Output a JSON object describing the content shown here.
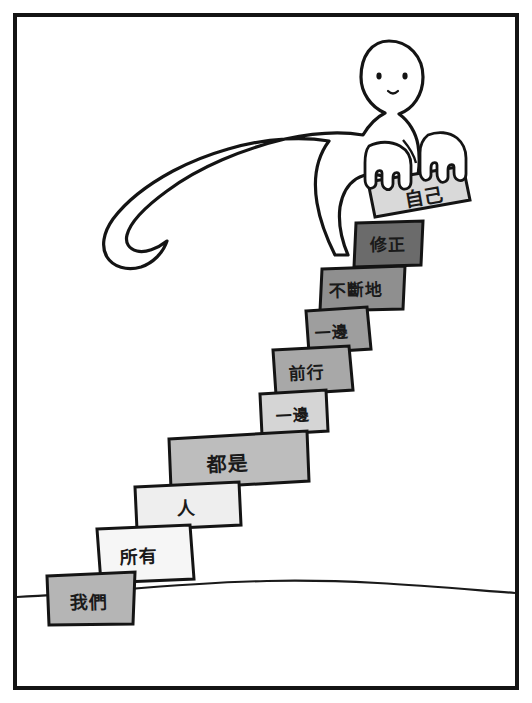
{
  "panel": {
    "type": "comic-illustration",
    "border_color": "#141414",
    "background": "#ffffff",
    "ground_line_color": "#1a1a1a",
    "figure": {
      "name": "cartoon-person",
      "description": "simple round-headed figure bending over, arms reaching down",
      "fill": "#ffffff",
      "outline": "#141414",
      "eye_color": "#141414"
    }
  },
  "sentence": "我們所有人都是一邊前行一邊不斷地修正自己",
  "steps": [
    {
      "label": "我們",
      "fill": "#b5b5b5",
      "order": 1
    },
    {
      "label": "所有",
      "fill": "#f6f6f6",
      "order": 2
    },
    {
      "label": "人",
      "fill": "#eeeeee",
      "order": 3
    },
    {
      "label": "都是",
      "fill": "#bdbdbd",
      "order": 4
    },
    {
      "label": "一邊",
      "fill": "#d5d5d5",
      "order": 5
    },
    {
      "label": "前行",
      "fill": "#a8a8a8",
      "order": 6
    },
    {
      "label": "一邊",
      "fill": "#9e9e9e",
      "order": 7
    },
    {
      "label": "不斷地",
      "fill": "#8f8f8f",
      "order": 8
    },
    {
      "label": "修正",
      "fill": "#6b6b6b",
      "order": 9
    }
  ],
  "held_block": {
    "label": "自己",
    "fill": "#d9d9d9",
    "order": 10
  }
}
